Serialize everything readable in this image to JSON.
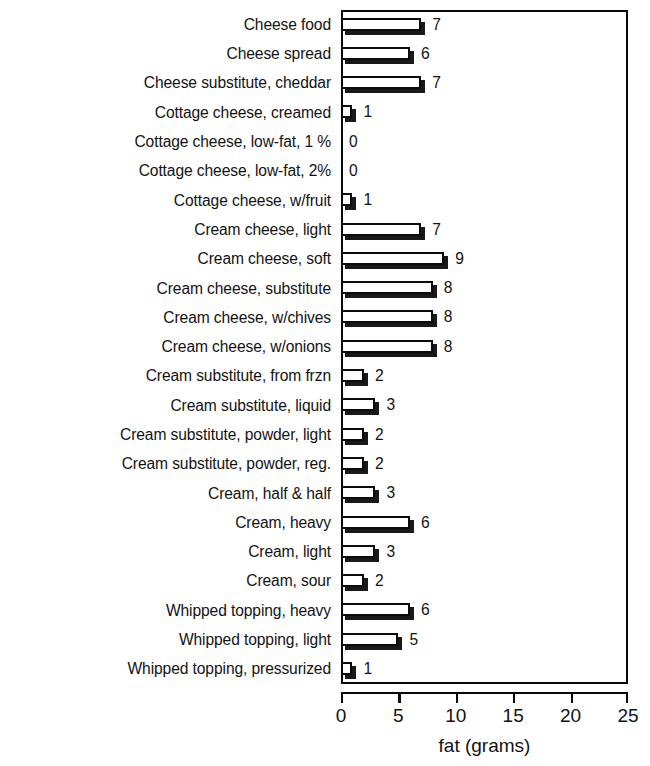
{
  "chart_data": {
    "type": "bar",
    "orientation": "horizontal",
    "title": "",
    "xlabel": "fat (grams)",
    "ylabel": "",
    "xlim": [
      0,
      25
    ],
    "xticks": [
      0,
      5,
      10,
      15,
      20,
      25
    ],
    "grid": false,
    "legend": null,
    "value_labels_shown": true,
    "categories": [
      "Cheese food",
      "Cheese spread",
      "Cheese substitute, cheddar",
      "Cottage cheese, creamed",
      "Cottage cheese, low-fat, 1 %",
      "Cottage cheese, low-fat, 2%",
      "Cottage cheese, w/fruit",
      "Cream cheese, light",
      "Cream cheese, soft",
      "Cream cheese, substitute",
      "Cream cheese, w/chives",
      "Cream cheese, w/onions",
      "Cream substitute, from frzn",
      "Cream substitute, liquid",
      "Cream substitute, powder, light",
      "Cream substitute, powder, reg.",
      "Cream, half & half",
      "Cream, heavy",
      "Cream, light",
      "Cream, sour",
      "Whipped topping, heavy",
      "Whipped topping, light",
      "Whipped topping, pressurized"
    ],
    "values": [
      7,
      6,
      7,
      1,
      0,
      0,
      1,
      7,
      9,
      8,
      8,
      8,
      2,
      3,
      2,
      2,
      3,
      6,
      3,
      2,
      6,
      5,
      1
    ],
    "value_label_text": [
      "7",
      "6",
      "7",
      "1",
      "0",
      "0",
      "1",
      "7",
      "9",
      "8",
      "8",
      "8",
      "2",
      "3",
      "2",
      "2",
      "3",
      "6",
      "3",
      "2",
      "6",
      "5",
      "1"
    ],
    "colors": {
      "bar_face": "#ffffff",
      "bar_outline": "#0b0b0b",
      "bar_shadow": "#191919",
      "axis": "#0a0a0a",
      "text": "#131313",
      "background": "#ffffff"
    }
  }
}
